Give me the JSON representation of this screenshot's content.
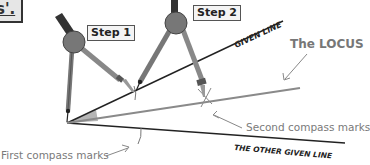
{
  "title": {
    "visible_fragment": "s'."
  },
  "steps": [
    {
      "label": "Step 1"
    },
    {
      "label": "Step 2"
    }
  ],
  "lines": {
    "given_line": "GIVEN LINE",
    "other_given_line": "THE OTHER GIVEN LINE",
    "locus": "The LOCUS"
  },
  "annotations": {
    "first_marks": "First compass marks",
    "second_marks": "Second compass marks"
  },
  "colors": {
    "line_dark": "#222222",
    "locus_gray": "#8a8a8a",
    "compass_gray": "#8c8c8c",
    "compass_dark": "#333333",
    "angle_fill": "#b5b5b5",
    "annotation_text": "#7a7a7a",
    "label_bg": "#f4f4f4"
  }
}
